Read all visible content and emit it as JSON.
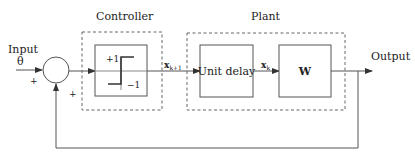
{
  "diagram": {
    "type": "block-diagram",
    "colors": {
      "line": "#555555",
      "dashed": "#666666",
      "text": "#222222",
      "background": "#ffffff"
    },
    "input": {
      "label": "Input",
      "symbol": "θ",
      "sign": "+"
    },
    "feedback": {
      "sign": "+"
    },
    "summing_junction": {
      "shape": "circle"
    },
    "controller": {
      "title": "Controller",
      "block": {
        "type": "signum",
        "upper_label": "+1",
        "lower_label": "−1"
      }
    },
    "signal_between": {
      "symbol": "x",
      "subscript": "k+1"
    },
    "plant": {
      "title": "Plant",
      "blocks": [
        {
          "label": "Unit delay"
        },
        {
          "label": "W"
        }
      ],
      "inner_signal": {
        "symbol": "x",
        "subscript": "k"
      }
    },
    "output": {
      "label": "Output"
    }
  }
}
